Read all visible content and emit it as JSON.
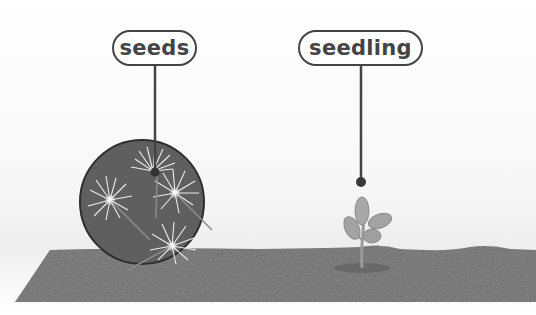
{
  "diagram": {
    "labels": [
      {
        "id": "seeds",
        "text": "seeds"
      },
      {
        "id": "seedling",
        "text": "seedling"
      }
    ],
    "colors": {
      "soil": "#6d6d6d",
      "magnifier": "#5f5f5f",
      "label_border": "#444444",
      "leaf": "#a3a3a3",
      "seed_fluff": "#eeeeee"
    }
  }
}
